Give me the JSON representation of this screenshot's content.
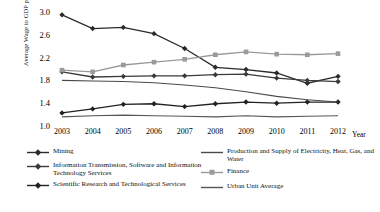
{
  "chart_data": {
    "type": "line",
    "title": "",
    "xlabel": "Year",
    "ylabel": "Average Wage to GDP per capita",
    "x": [
      2003,
      2004,
      2005,
      2006,
      2007,
      2008,
      2009,
      2010,
      2011,
      2012
    ],
    "xticklabels": [
      "2003",
      "2004",
      "2005",
      "2006",
      "2007",
      "2008",
      "2009",
      "2010",
      "2011",
      "2012"
    ],
    "yticklabels": [
      "3.0",
      "2.6",
      "2.2",
      "1.8",
      "1.4",
      "1.0"
    ],
    "ytickvalues": [
      3.0,
      2.6,
      2.2,
      1.8,
      1.4,
      1.0
    ],
    "ylim": [
      1.0,
      3.05
    ],
    "xlim": [
      2003,
      2012
    ],
    "grid": false,
    "legend_position": "below",
    "series": [
      {
        "name": "Mining",
        "marker": "diamond",
        "color": "#2b2b2b",
        "values": [
          2.95,
          2.71,
          2.73,
          2.62,
          2.36,
          2.03,
          1.99,
          1.93,
          1.75,
          1.87
        ]
      },
      {
        "name": "Information Transmission, Software and Information Technology Services",
        "marker": "diamond",
        "color": "#3a3a3a",
        "values": [
          1.95,
          1.86,
          1.87,
          1.88,
          1.88,
          1.9,
          1.91,
          1.84,
          1.8,
          1.78
        ]
      },
      {
        "name": "Scientific Research and Technological Services",
        "marker": "diamond",
        "color": "#222222",
        "values": [
          1.23,
          1.3,
          1.38,
          1.39,
          1.34,
          1.39,
          1.42,
          1.4,
          1.42,
          1.42
        ]
      },
      {
        "name": "Production and Supply of Electricity, Heat, Gas, and Water",
        "marker": "none",
        "color": "#4a4a4a",
        "values": [
          1.8,
          1.79,
          1.78,
          1.76,
          1.72,
          1.67,
          1.6,
          1.52,
          1.46,
          1.42
        ]
      },
      {
        "name": "Finance",
        "marker": "square",
        "color": "#9a9a9a",
        "values": [
          1.98,
          1.95,
          2.07,
          2.12,
          2.17,
          2.25,
          2.3,
          2.26,
          2.25,
          2.27
        ]
      },
      {
        "name": "Urban Unit Average",
        "marker": "none",
        "color": "#555555",
        "values": [
          1.16,
          1.18,
          1.19,
          1.18,
          1.17,
          1.16,
          1.18,
          1.16,
          1.17,
          1.18
        ]
      }
    ],
    "legend": [
      {
        "label": "Mining",
        "marker": "diamond",
        "color": "#2b2b2b",
        "column": "left"
      },
      {
        "label": "Information Transmission, Software and Information Technology Services",
        "marker": "diamond",
        "color": "#3a3a3a",
        "column": "left"
      },
      {
        "label": "Scientific Research and Technological Services",
        "marker": "diamond",
        "color": "#222222",
        "column": "left"
      },
      {
        "label": "Production and Supply of Electricity, Heat, Gas, and Water",
        "marker": "none",
        "color": "#4a4a4a",
        "column": "right"
      },
      {
        "label": "Finance",
        "marker": "square",
        "color": "#9a9a9a",
        "column": "right"
      },
      {
        "label": "Urban Unit Average",
        "marker": "none",
        "color": "#555555",
        "column": "right"
      }
    ]
  }
}
